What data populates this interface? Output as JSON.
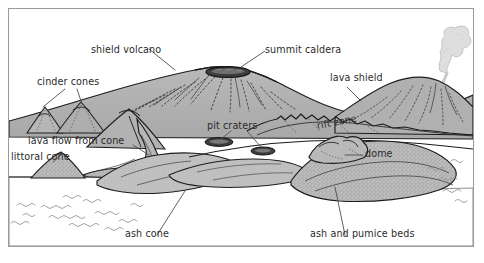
{
  "figure": {
    "type": "geological-cross-section-diagram",
    "width": 484,
    "height": 263
  },
  "colors": {
    "page_background": "#ffffff",
    "frame_border": "#9a9a9a",
    "land_fill": "#b3b3b3",
    "land_fill_light": "#c2c2c2",
    "land_fill_dark": "#9c9c9c",
    "outline": "#1c1c1c",
    "water_fill": "#ffffff",
    "wave_stroke": "#9b9b9b",
    "crater_dark": "#3a3a3a",
    "plume_fill": "#dedede",
    "plume_stroke": "#b5b5b5",
    "label_text": "#2b2b2b",
    "leader_line": "#5a5a5a"
  },
  "labels": [
    {
      "id": "shield-volcano",
      "text": "shield volcano",
      "x": 82,
      "y": 36
    },
    {
      "id": "summit-caldera",
      "text": "summit caldera",
      "x": 264,
      "y": 36
    },
    {
      "id": "cinder-cones",
      "text": "cinder cones",
      "x": 36,
      "y": 71
    },
    {
      "id": "lava-shield",
      "text": "lava shield",
      "x": 329,
      "y": 66
    },
    {
      "id": "pit-craters",
      "text": "pit craters",
      "x": 206,
      "y": 117
    },
    {
      "id": "rift-zone",
      "text": "rift  zone",
      "x": 316,
      "y": 112
    },
    {
      "id": "lava-flow-from-cone",
      "text": "lava flow from cone",
      "x": 27,
      "y": 135
    },
    {
      "id": "littoral-cone",
      "text": "littoral cone",
      "x": 8,
      "y": 150
    },
    {
      "id": "dome",
      "text": "dome",
      "x": 358,
      "y": 143
    },
    {
      "id": "ash-cone",
      "text": "ash cone",
      "x": 124,
      "y": 228
    },
    {
      "id": "ash-and-pumice-beds",
      "text": "ash and pumice beds",
      "x": 309,
      "y": 228
    }
  ],
  "features": {
    "shield_volcano": "large broad gently-sloping shield with dotted radial lava flow lines",
    "summit_caldera": "dark elongated elliptical depression at the shield summit",
    "cinder_cones": "two small steep cones on the left flank",
    "lava_shield": "secondary smaller shield right of the main edifice",
    "pit_craters": "two small dark ellipses on the lower flank",
    "rift_zone": "jagged fissure ridge trending across the right flank",
    "lava_flow_from_cone": "elongated lobate flow running down toward the shore",
    "littoral_cone": "small stippled cone at the waterline",
    "dome": "rounded knobby lava dome on the right",
    "ash_cone": "broad stippled low cone at the shoreline",
    "ash_and_pumice_beds": "stippled layered deposits beneath the dome",
    "plume": "light grey billowing steam plume rising from the right vent",
    "water": "white sea surface with grey wave squiggles"
  }
}
